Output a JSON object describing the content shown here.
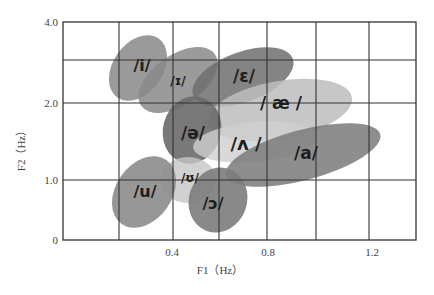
{
  "chart_data": {
    "type": "scatter",
    "subtype": "vowel-region-ellipses",
    "title": "",
    "xlabel": "F1（Hz）",
    "ylabel": "F2（Hz）",
    "x_ticks": [
      "0.4",
      "0.8",
      "1.2"
    ],
    "y_ticks": [
      "0",
      "1.0",
      "2.0",
      "4.0"
    ],
    "grid": true,
    "legend": "none",
    "series": [
      {
        "name": "/i/",
        "label": "/i/",
        "f1": 0.27,
        "f2": 3.1,
        "shade": "#8f8f8f"
      },
      {
        "name": "/ɪ/",
        "label": "/ɪ/",
        "f1": 0.43,
        "f2": 2.6,
        "shade": "#8a8a8a"
      },
      {
        "name": "/ɛ/",
        "label": "/ɛ/",
        "f1": 0.66,
        "f2": 2.7,
        "shade": "#6e6e6e"
      },
      {
        "name": "/æ/",
        "label": "/ æ /",
        "f1": 0.82,
        "f2": 2.0,
        "shade": "#bdbdbd"
      },
      {
        "name": "/ə/",
        "label": "/ə/",
        "f1": 0.51,
        "f2": 1.6,
        "shade": "#6a6a6a"
      },
      {
        "name": "/ʌ/",
        "label": "/ʌ /",
        "f1": 0.73,
        "f2": 1.3,
        "shade": "#cfcfcf"
      },
      {
        "name": "/a/",
        "label": "/a/",
        "f1": 1.0,
        "f2": 1.1,
        "shade": "#7a7a7a"
      },
      {
        "name": "/ʊ/",
        "label": "/ʊ/",
        "f1": 0.52,
        "f2": 0.9,
        "shade": "#c6c6c6"
      },
      {
        "name": "/u/",
        "label": "/u/",
        "f1": 0.31,
        "f2": 0.6,
        "shade": "#8c8c8c"
      },
      {
        "name": "/ɔ/",
        "label": "/ɔ/",
        "f1": 0.6,
        "f2": 0.5,
        "shade": "#7c7c7c"
      }
    ]
  }
}
